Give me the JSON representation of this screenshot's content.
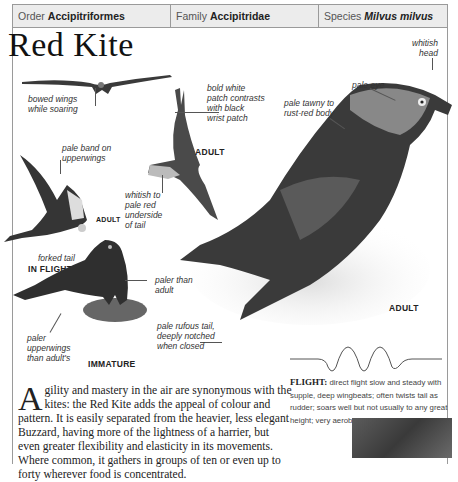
{
  "header": {
    "order_label": "Order",
    "order_value": "Accipitriformes",
    "family_label": "Family",
    "family_value": "Accipitridae",
    "species_label": "Species",
    "species_value": "Milvus milvus"
  },
  "title": "Red Kite",
  "annotations": {
    "bowed_wings": [
      "bowed wings",
      "while soaring"
    ],
    "bold_white_patch": [
      "bold white",
      "patch contrasts",
      "with black",
      "wrist patch"
    ],
    "pale_eye": "pale eye",
    "whitish_head": [
      "whitish",
      "head"
    ],
    "pale_tawny": [
      "pale tawny to",
      "rust-red body"
    ],
    "pale_band": [
      "pale band on",
      "upperwings"
    ],
    "whitish_tail": [
      "whitish to",
      "pale red",
      "underside",
      "of tail"
    ],
    "forked_tail": "forked tail",
    "paler_than_adult": [
      "paler than",
      "adult"
    ],
    "pale_rufous_tail": [
      "pale rufous tail,",
      "deeply notched",
      "when closed"
    ],
    "paler_upperwings": [
      "paler",
      "upperwings",
      "than adult's"
    ]
  },
  "captions": {
    "adult_flight_top": "ADULT",
    "adult_flight_left": "ADULT",
    "in_flight": "IN FLIGHT",
    "immature": "IMMATURE",
    "adult_main": "ADULT"
  },
  "body": {
    "dropcap": "A",
    "text": "gility and mastery in the air are synonymous with the kites: the Red Kite adds the appeal of colour and pattern. It is easily separated from the heavier, less elegant Buzzard, having more of the lightness of a harrier, but even greater flexibility and elasticity in its movements. Where common, it gathers in groups of ten or even up to forty wherever food is concentrated."
  },
  "flight": {
    "label": "FLIGHT:",
    "text": " direct flight slow and steady with supple, deep wingbeats; often twists tail as rudder; soars well but not usually to any great height; very aerobatic."
  }
}
